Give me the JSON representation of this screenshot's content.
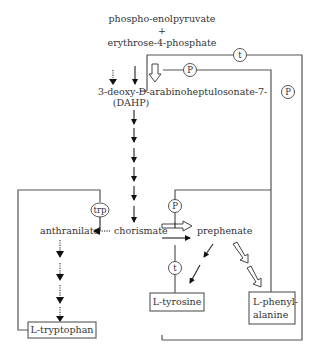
{
  "diagram": {
    "nodes": {
      "pep": "phospho-enolpyruvate",
      "plus": "+",
      "e4p": "erythrose-4-phosphate",
      "dahp": "3-deoxy-D-arabinoheptulosonate-7-",
      "dahp_p": "P",
      "dahp_abbr": "(DAHP)",
      "chorismate": "chorismate",
      "prephenate": "prephenate",
      "anthranilate": "anthranilate",
      "tyrosine": "L-tyrosine",
      "phenylalanine_1": "L-phenyl-",
      "phenylalanine_2": "alanine",
      "tryptophan": "L-tryptophan"
    },
    "regulators": {
      "t_top": "t",
      "p_top": "P",
      "trp": "trp",
      "p_mid": "P",
      "t_mid": "t"
    },
    "arrow_types": {
      "dashed_filled": "tryptophan-sensitive enzyme pathway",
      "solid_filled": "tyrosine-sensitive enzyme pathway",
      "open": "phenylalanine-sensitive enzyme pathway"
    }
  }
}
